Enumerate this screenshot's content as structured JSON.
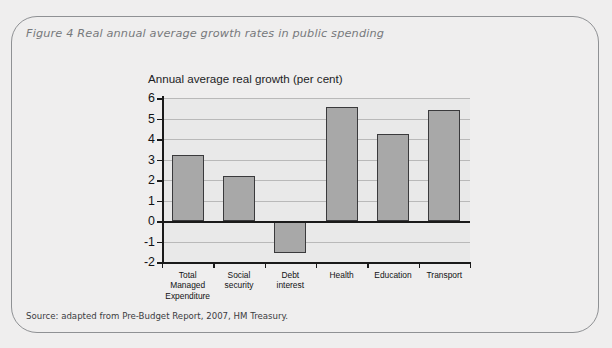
{
  "figure": {
    "title": "Figure 4 Real annual average growth rates in public spending",
    "source": "Source: adapted from Pre-Budget Report, 2007, HM Treasury."
  },
  "colors": {
    "page_background": "#efeeee",
    "panel_border": "#8f9194",
    "title_text": "#77797c",
    "plot_background": "#e9e9e9",
    "bar_fill": "#a8a8a8",
    "bar_border": "#3a3a3c",
    "gridline": "#b9b9b9",
    "axis": "#1a1a1a"
  },
  "chart_data": {
    "type": "bar",
    "title": "Annual average real growth (per cent)",
    "xlabel": "",
    "ylabel": "Annual average real growth (per cent)",
    "categories": [
      "Total\nManaged\nExpenditure",
      "Social\nsecurity",
      "Debt\ninterest",
      "Health",
      "Education",
      "Transport"
    ],
    "values": [
      3.2,
      2.2,
      -1.55,
      5.55,
      4.25,
      5.4
    ],
    "ylim": [
      -2,
      6
    ],
    "ytick_labels": [
      "6",
      "5",
      "4",
      "3",
      "2",
      "1",
      "0",
      "-1",
      "-2"
    ],
    "yticks": [
      6,
      5,
      4,
      3,
      2,
      1,
      0,
      -1,
      -2
    ],
    "grid": true,
    "legend": null
  }
}
